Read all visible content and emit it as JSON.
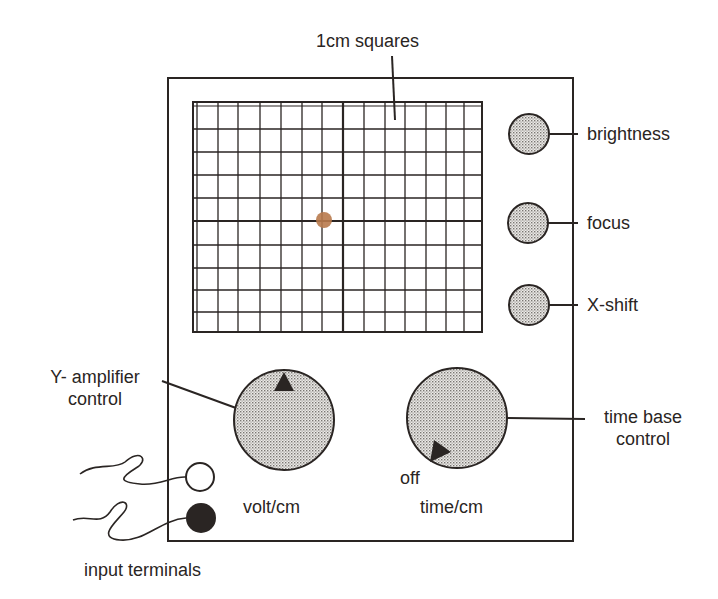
{
  "diagram": {
    "colors": {
      "ink": "#2a2523",
      "knob_fill": "#d9d6d2",
      "spot": "#b87a4c",
      "background": "#ffffff"
    },
    "screen": {
      "label": "1cm squares",
      "columns": 14,
      "rows": 10,
      "spot": "centre dot"
    },
    "right_controls": [
      {
        "label": "brightness"
      },
      {
        "label": "focus"
      },
      {
        "label": "X-shift"
      }
    ],
    "y_amplifier": {
      "label_line1": "Y- amplifier",
      "label_line2": "control",
      "unit_label": "volt/cm"
    },
    "time_base": {
      "label_line1": "time base",
      "label_line2": "control",
      "unit_label": "time/cm",
      "off_label": "off"
    },
    "terminals": {
      "label": "input terminals"
    }
  }
}
